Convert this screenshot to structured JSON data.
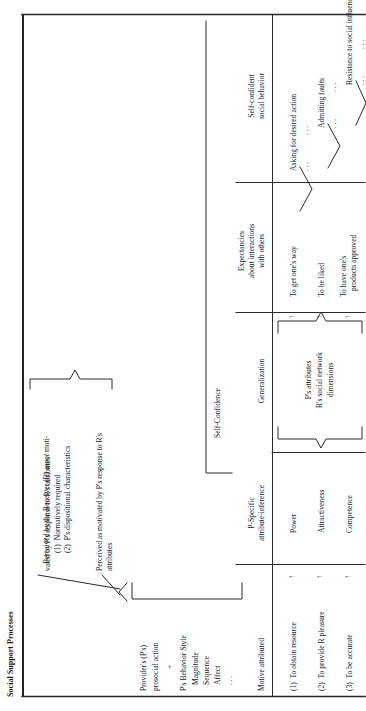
{
  "figure": {
    "title": "Social Support Processes",
    "left_block": {
      "line1": "Provider's (P's)",
      "line2": "prosocial action",
      "plus": "+",
      "line3": "P's Behavior Style",
      "items": [
        "Magnitude",
        "Sequence",
        "Affect",
        ". . ."
      ]
    },
    "perception_branches": {
      "top": {
        "line1": "Perceived by the Receiver (R) as",
        "emph": "not",
        "line1_tail": " moti-",
        "line2": "vated by P's response to R's attributes",
        "sub1": "(1)  Normatively required",
        "sub2": "(2)  P's dispositional characteristics"
      },
      "bottom": {
        "line1": "Perceived as motivated by P's response to R's",
        "line2": "attributes"
      }
    },
    "self_confidence_brace_label": "Self-Confidence",
    "columns": {
      "motive": {
        "header": "Motive attributed"
      },
      "attribute_inference": {
        "header_line1": "P-Specific",
        "header_line2": "attribute-inference"
      },
      "generalization": {
        "header": "Generalization",
        "brace_line1": "P's attributes",
        "brace_line2": "R's social network",
        "brace_line3": "dimensions"
      },
      "expectancies": {
        "header_line1": "Expectancies",
        "header_line2": "about interactions",
        "header_line3": "with others"
      },
      "behavior": {
        "header_line1": "Self-confident",
        "header_line2": "social behavior"
      }
    },
    "rows": [
      {
        "motive": "(1)  To obtain resource",
        "attribute": "Power",
        "expectancy": "To get one's way",
        "behavior": "Asking for desired action",
        "dots_left": ". . .",
        "dots_right": ". . ."
      },
      {
        "motive": "(2)  To provide R pleasure",
        "attribute": "Attractiveness",
        "expectancy": "To be liked",
        "behavior": "Admitting faults",
        "dots_left": ". . .",
        "dots_right": ". . ."
      },
      {
        "motive": "(3)  To be accurate",
        "attribute": "Competence",
        "expectancy_line1": "To have one's",
        "expectancy_line2": "products approved",
        "behavior": "Resistance to social influence",
        "dots_left": ". . .",
        "dots_right": ". . ."
      }
    ],
    "arrow_glyph": "↑",
    "colors": {
      "ink": "#1a1a1a",
      "rule": "#2a2a2a"
    }
  }
}
